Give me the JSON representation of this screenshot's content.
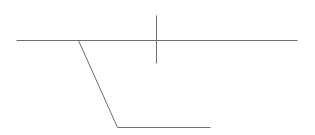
{
  "diagram": {
    "width": 315,
    "height": 135,
    "background": "#ffffff",
    "stroke_color": "#6e6e6e",
    "stroke_width": 1,
    "segments": [
      {
        "name": "main-horizontal-line",
        "x1": 16,
        "y1": 40,
        "x2": 297,
        "y2": 40
      },
      {
        "name": "vertical-tick-line",
        "x1": 156,
        "y1": 15,
        "x2": 156,
        "y2": 63
      },
      {
        "name": "diagonal-line",
        "x1": 78,
        "y1": 40,
        "x2": 117,
        "y2": 127
      },
      {
        "name": "bottom-horizontal-line",
        "x1": 117,
        "y1": 127,
        "x2": 210,
        "y2": 127
      }
    ]
  }
}
